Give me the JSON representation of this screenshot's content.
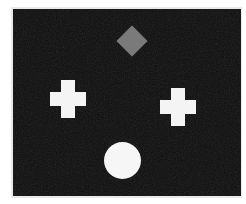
{
  "scene": {
    "title": "Geometric shapes on dark background",
    "canvas": {
      "width": 246,
      "height": 204,
      "background_color": "#ffffff"
    },
    "panel": {
      "label": "dark-noise-panel",
      "background_color": "#0c0c0c",
      "frame_color": "#e9e9e9",
      "texture": "grain",
      "x": 13,
      "y": 9,
      "width": 228,
      "height": 187
    },
    "shapes": [
      {
        "id": "diamond",
        "name": "diamond",
        "label": "Diamond",
        "color": "#7a7a7a",
        "color_name": "gray",
        "position": "top-center",
        "center_x": 119,
        "center_y": 32,
        "size": 31
      },
      {
        "id": "cross-left",
        "name": "cross",
        "label": "Cross",
        "color": "#f4f4f4",
        "color_name": "white",
        "position": "middle-left",
        "center_x": 55,
        "center_y": 90,
        "size": 38
      },
      {
        "id": "cross-right",
        "name": "cross",
        "label": "Cross",
        "color": "#f4f4f4",
        "color_name": "white",
        "position": "middle-right",
        "center_x": 165,
        "center_y": 98,
        "size": 38
      },
      {
        "id": "circle",
        "name": "circle",
        "label": "Circle",
        "color": "#f6f6f6",
        "color_name": "white",
        "position": "bottom-center",
        "center_x": 109,
        "center_y": 151,
        "size": 37
      }
    ]
  }
}
